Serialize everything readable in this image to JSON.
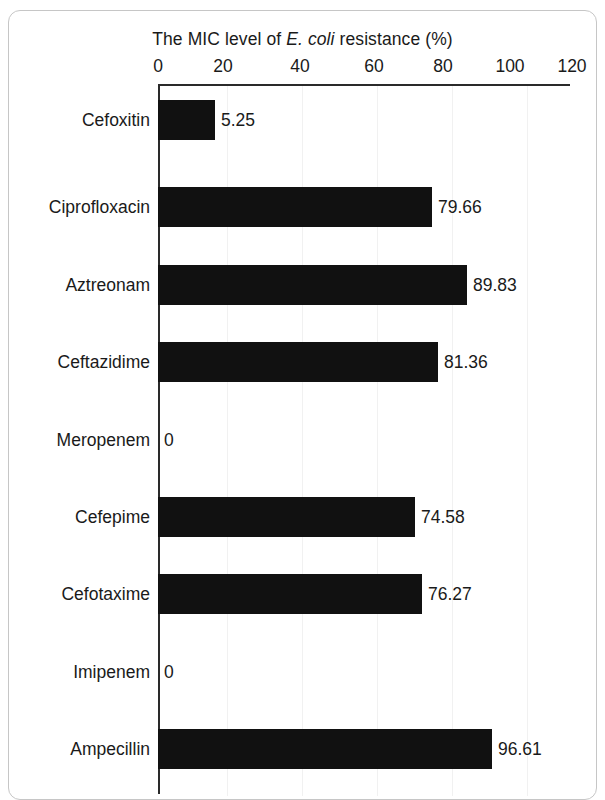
{
  "figure": {
    "title_prefix": "The MIC level of ",
    "title_italic": "E. coli",
    "title_suffix": " resistance (%)"
  },
  "chart_data": {
    "type": "bar",
    "orientation": "horizontal",
    "title": "The MIC level of E. coli resistance (%)",
    "xlabel": "The MIC level of E. coli resistance (%)",
    "ylabel": "",
    "xlim": [
      0,
      120
    ],
    "xticks": [
      0,
      20,
      40,
      60,
      80,
      100,
      120
    ],
    "xticklabels": [
      "0",
      "20",
      "40",
      "60",
      "80",
      "100",
      "120"
    ],
    "grid": false,
    "legend": null,
    "bar_color": "#111111",
    "categories": [
      "Cefoxitin",
      "Ciprofloxacin",
      "Aztreonam",
      "Ceftazidime",
      "Meropenem",
      "Cefepime",
      "Cefotaxime",
      "Imipenem",
      "Ampecillin"
    ],
    "values": [
      5.25,
      79.66,
      89.83,
      81.36,
      0,
      74.58,
      76.27,
      0,
      96.61
    ],
    "value_labels": [
      "5.25",
      "79.66",
      "89.83",
      "81.36",
      "0",
      "74.58",
      "76.27",
      "0",
      "96.61"
    ],
    "bar_pixel_widths": [
      57,
      274,
      309,
      280,
      0,
      257,
      264,
      0,
      334
    ],
    "note": "Bar lengths as drawn in the source figure are not strictly proportional to the printed values; pixel widths recorded as rendered."
  },
  "rows": [
    {
      "label": "Cefoxitin",
      "value_label": "5.25",
      "bar_px": 57,
      "top": 100
    },
    {
      "label": "Ciprofloxacin",
      "value_label": "79.66",
      "bar_px": 274,
      "top": 187
    },
    {
      "label": "Aztreonam",
      "value_label": "89.83",
      "bar_px": 309,
      "top": 265
    },
    {
      "label": "Ceftazidime",
      "value_label": "81.36",
      "bar_px": 280,
      "top": 342
    },
    {
      "label": "Meropenem",
      "value_label": "0",
      "bar_px": 0,
      "top": 420
    },
    {
      "label": "Cefepime",
      "value_label": "74.58",
      "bar_px": 257,
      "top": 497
    },
    {
      "label": "Cefotaxime",
      "value_label": "76.27",
      "bar_px": 264,
      "top": 574
    },
    {
      "label": "Imipenem",
      "value_label": "0",
      "bar_px": 0,
      "top": 652
    },
    {
      "label": "Ampecillin",
      "value_label": "96.61",
      "bar_px": 334,
      "top": 729
    }
  ],
  "xticks": [
    {
      "label": "0",
      "x": 158
    },
    {
      "label": "20",
      "x": 223
    },
    {
      "label": "40",
      "x": 300
    },
    {
      "label": "60",
      "x": 374
    },
    {
      "label": "80",
      "x": 443
    },
    {
      "label": "100",
      "x": 510
    },
    {
      "label": "120",
      "x": 572
    }
  ],
  "gridlines": [
    225,
    300,
    375,
    450,
    525
  ]
}
